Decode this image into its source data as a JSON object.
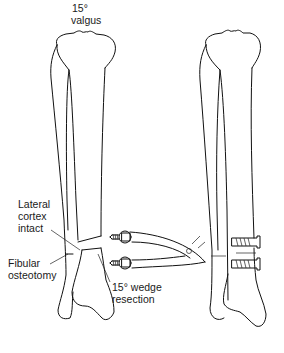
{
  "labels": {
    "angle_top": "15°",
    "valgus": "valgus",
    "lateral_1": "Lateral",
    "lateral_2": "cortex",
    "lateral_3": "intact",
    "fibular_1": "Fibular",
    "fibular_2": "osteotomy",
    "wedge_1": "15° wedge",
    "wedge_2": "resection"
  },
  "figures": [
    {
      "name": "pre-correction tibia and fibula with wedge resection"
    },
    {
      "name": "post-correction tibia and fibula fixed with two screws"
    }
  ],
  "instrument": "screw-holding forceps"
}
